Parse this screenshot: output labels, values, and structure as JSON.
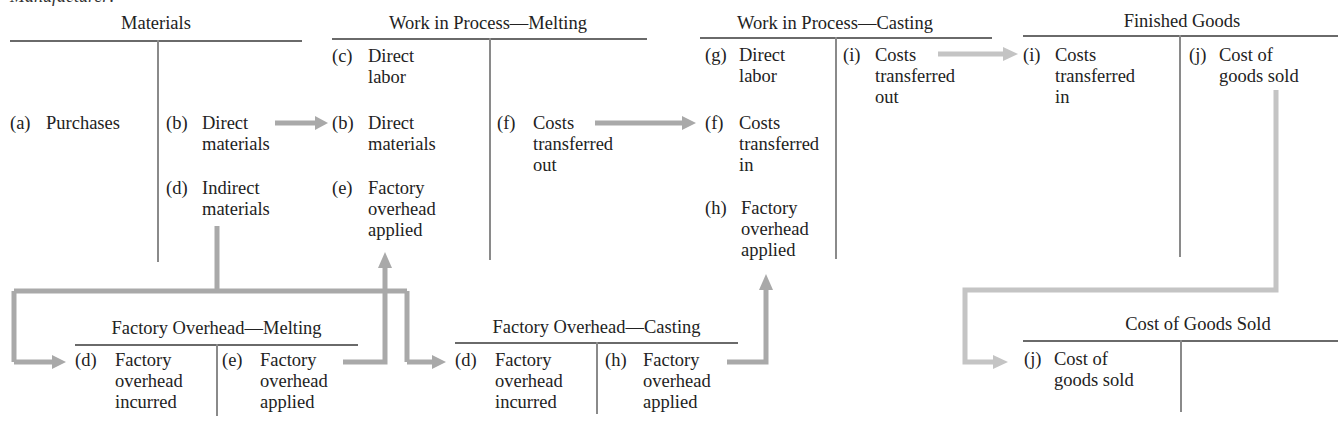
{
  "header_fragment": "Manufacturer:",
  "accounts": {
    "materials": {
      "title": "Materials",
      "debit": [
        {
          "label": "(a)",
          "text": "Purchases"
        }
      ],
      "credit": [
        {
          "label": "(b)",
          "lines": [
            "Direct",
            "materials"
          ]
        },
        {
          "label": "(d)",
          "lines": [
            "Indirect",
            "materials"
          ]
        }
      ]
    },
    "wip_melting": {
      "title": "Work in Process—Melting",
      "debit": [
        {
          "label": "(c)",
          "lines": [
            "Direct",
            "labor"
          ]
        },
        {
          "label": "(b)",
          "lines": [
            "Direct",
            "materials"
          ]
        },
        {
          "label": "(e)",
          "lines": [
            "Factory",
            "overhead",
            "applied"
          ]
        }
      ],
      "credit": [
        {
          "label": "(f)",
          "lines": [
            "Costs",
            "transferred",
            "out"
          ]
        }
      ]
    },
    "wip_casting": {
      "title": "Work in Process—Casting",
      "debit": [
        {
          "label": "(g)",
          "lines": [
            "Direct",
            "labor"
          ]
        },
        {
          "label": "(f)",
          "lines": [
            "Costs",
            "transferred",
            "in"
          ]
        },
        {
          "label": "(h)",
          "lines": [
            "Factory",
            "overhead",
            "applied"
          ]
        }
      ],
      "credit": [
        {
          "label": "(i)",
          "lines": [
            "Costs",
            "transferred",
            "out"
          ]
        }
      ]
    },
    "finished_goods": {
      "title": "Finished Goods",
      "debit": [
        {
          "label": "(i)",
          "lines": [
            "Costs",
            "transferred",
            "in"
          ]
        }
      ],
      "credit": [
        {
          "label": "(j)",
          "lines": [
            "Cost of",
            "goods sold"
          ]
        }
      ]
    },
    "foh_melting": {
      "title": "Factory Overhead—Melting",
      "debit": [
        {
          "label": "(d)",
          "lines": [
            "Factory",
            "overhead",
            "incurred"
          ]
        }
      ],
      "credit": [
        {
          "label": "(e)",
          "lines": [
            "Factory",
            "overhead",
            "applied"
          ]
        }
      ]
    },
    "foh_casting": {
      "title": "Factory Overhead—Casting",
      "debit": [
        {
          "label": "(d)",
          "lines": [
            "Factory",
            "overhead",
            "incurred"
          ]
        }
      ],
      "credit": [
        {
          "label": "(h)",
          "lines": [
            "Factory",
            "overhead",
            "applied"
          ]
        }
      ]
    },
    "cogs": {
      "title": "Cost of Goods Sold",
      "debit": [
        {
          "label": "(j)",
          "lines": [
            "Cost of",
            "goods sold"
          ]
        }
      ],
      "credit": []
    }
  },
  "flows": [
    {
      "from": "Materials (b) Direct materials",
      "to": "Work in Process—Melting (b)"
    },
    {
      "from": "Work in Process—Melting (f)",
      "to": "Work in Process—Casting (f)"
    },
    {
      "from": "Work in Process—Casting (i)",
      "to": "Finished Goods (i)"
    },
    {
      "from": "Materials (d) Indirect materials",
      "to": "Factory Overhead—Melting (d)"
    },
    {
      "from": "Materials (d) Indirect materials",
      "to": "Factory Overhead—Casting (d)"
    },
    {
      "from": "Factory Overhead—Melting (e)",
      "to": "Work in Process—Melting (e)"
    },
    {
      "from": "Factory Overhead—Casting (h)",
      "to": "Work in Process—Casting (h)"
    },
    {
      "from": "Finished Goods (j)",
      "to": "Cost of Goods Sold (j)"
    }
  ],
  "colors": {
    "arrow": "#a9a9a9",
    "arrow_light": "#c4c4c4",
    "rule": "#6a6a6a",
    "text": "#222222"
  }
}
